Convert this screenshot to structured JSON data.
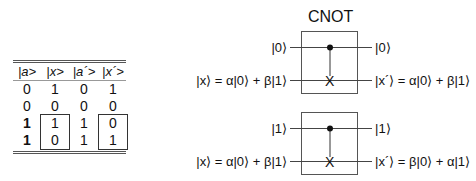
{
  "truth_table": {
    "headers": [
      "|a>",
      "|x>",
      "|a´>",
      "|x´>"
    ],
    "rows": [
      [
        "0",
        "1",
        "0",
        "1"
      ],
      [
        "0",
        "0",
        "0",
        "0"
      ],
      [
        "1",
        "1",
        "1",
        "0"
      ],
      [
        "1",
        "0",
        "1",
        "1"
      ]
    ],
    "bold_first_column_rows": [
      2,
      3
    ],
    "boxed_columns": [
      1,
      3
    ],
    "boxed_rows": [
      2,
      3
    ]
  },
  "circuit_title": "CNOT",
  "circuits": [
    {
      "control_in": "|0⟩",
      "control_out": "|0⟩",
      "target_in": "|x⟩ = α|0⟩ + β|1⟩",
      "target_out": "|x´⟩ = α|0⟩ + β|1⟩",
      "target_symbol": "X"
    },
    {
      "control_in": "|1⟩",
      "control_out": "|1⟩",
      "target_in": "|x⟩ = α|0⟩ + β|1⟩",
      "target_out": "|x´⟩ = β|0⟩ + α|1⟩",
      "target_symbol": "X"
    }
  ]
}
